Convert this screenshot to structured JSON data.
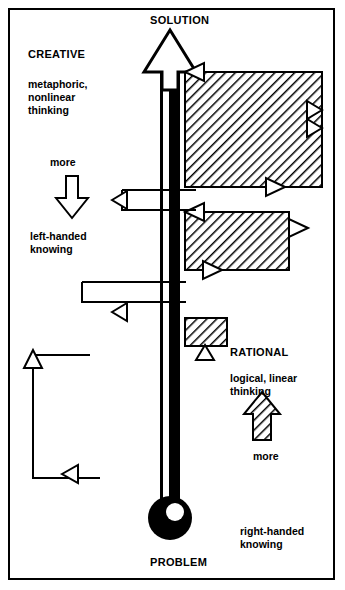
{
  "diagram": {
    "title_top": "SOLUTION",
    "title_bottom": "PROBLEM",
    "left_side": {
      "heading": "CREATIVE",
      "description": "metaphoric,\nnonlinear\nthinking",
      "more_label": "more",
      "knowing_label": "left-handed\nknowing"
    },
    "right_side": {
      "heading": "RATIONAL",
      "description": "logical, linear\nthinking",
      "more_label": "more",
      "knowing_label": "right-handed\nknowing"
    },
    "colors": {
      "ink": "#000000",
      "paper": "#ffffff",
      "hatch": "#000000"
    },
    "bars": [
      {
        "name": "bar-1",
        "width_units": 4
      },
      {
        "name": "bar-2",
        "width_units": 3
      },
      {
        "name": "bar-3",
        "width_units": 1.2
      }
    ],
    "steps_left": [
      {
        "name": "step-1"
      },
      {
        "name": "step-2"
      },
      {
        "name": "step-3"
      }
    ]
  }
}
